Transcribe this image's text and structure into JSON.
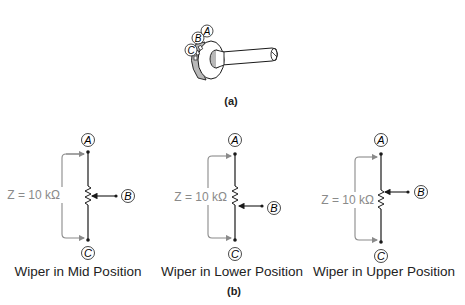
{
  "figure_a": {
    "label": "(a)",
    "terminals": [
      "A",
      "B",
      "C"
    ]
  },
  "figure_b": {
    "label": "(b)",
    "panels": [
      {
        "caption": "Wiper in Mid Position",
        "impedance": "Z = 10 kΩ",
        "wiper_position": "mid",
        "terminal_top": "A",
        "terminal_wiper": "B",
        "terminal_bottom": "C"
      },
      {
        "caption": "Wiper in Lower Position",
        "impedance": "Z = 10 kΩ",
        "wiper_position": "lower",
        "terminal_top": "A",
        "terminal_wiper": "B",
        "terminal_bottom": "C"
      },
      {
        "caption": "Wiper in Upper Position",
        "impedance": "Z = 10 kΩ",
        "wiper_position": "upper",
        "terminal_top": "A",
        "terminal_wiper": "B",
        "terminal_bottom": "C"
      }
    ]
  },
  "colors": {
    "line": "#1a1a1a",
    "annotation": "#8a8a8a",
    "body_shade": "#b8b8b8"
  }
}
